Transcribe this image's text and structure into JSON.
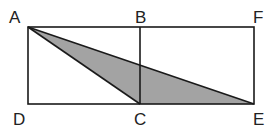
{
  "figure": {
    "type": "geometry",
    "points": {
      "A": {
        "label": "A",
        "x": 28,
        "y": 27
      },
      "B": {
        "label": "B",
        "x": 140,
        "y": 27
      },
      "F": {
        "label": "F",
        "x": 254,
        "y": 27
      },
      "D": {
        "label": "D",
        "x": 28,
        "y": 104
      },
      "C": {
        "label": "C",
        "x": 140,
        "y": 104
      },
      "E": {
        "label": "E",
        "x": 254,
        "y": 104
      }
    },
    "segments": [
      "AF",
      "DE",
      "AD",
      "BC",
      "FE",
      "AC",
      "AE"
    ],
    "shaded_region": [
      "A",
      "C",
      "E"
    ],
    "colors": {
      "stroke": "#1a1a1a",
      "shade": "#a3a3a3",
      "background": "#ffffff"
    }
  }
}
